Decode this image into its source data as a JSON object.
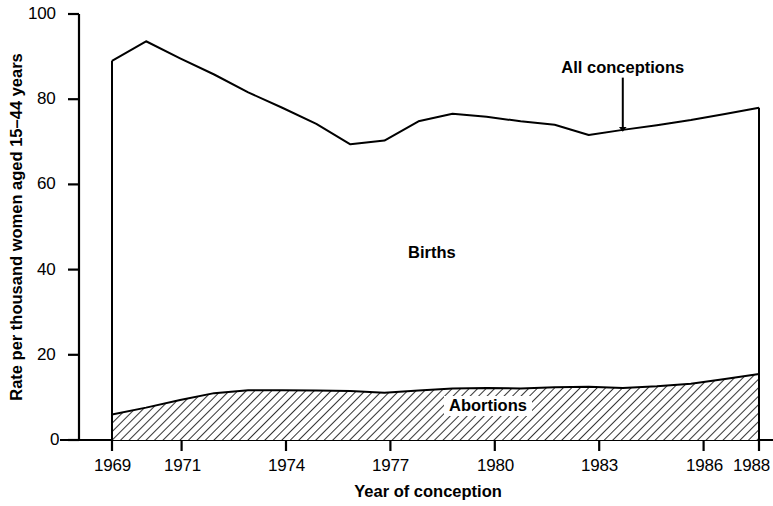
{
  "chart_data": {
    "type": "area",
    "title": "",
    "subtitle": "",
    "xlabel": "Year of conception",
    "ylabel": "Rate per thousand women aged 15–44 years",
    "xlim": [
      1969,
      1988
    ],
    "ylim": [
      0,
      100
    ],
    "grid": false,
    "legend_position": "inline-annotations",
    "x_tick_labels": [
      "1969",
      "1971",
      "1974",
      "1977",
      "1980",
      "1983",
      "1986",
      "1988"
    ],
    "x_tick_values": [
      1969,
      1971,
      1974,
      1977,
      1980,
      1983,
      1986,
      1988
    ],
    "y_tick_labels": [
      "0",
      "20",
      "40",
      "60",
      "80",
      "100"
    ],
    "y_tick_values": [
      0,
      20,
      40,
      60,
      80,
      100
    ],
    "x": [
      1969,
      1970,
      1971,
      1972,
      1973,
      1974,
      1975,
      1976,
      1977,
      1978,
      1979,
      1980,
      1981,
      1982,
      1983,
      1984,
      1985,
      1986,
      1987,
      1988
    ],
    "series": [
      {
        "name": "All conceptions",
        "style": "line",
        "values": [
          89.0,
          93.6,
          89.6,
          85.8,
          81.6,
          78.0,
          74.2,
          69.4,
          70.3,
          74.8,
          76.6,
          75.9,
          74.8,
          74.0,
          71.6,
          72.8,
          73.9,
          75.1,
          76.5,
          78.0
        ]
      },
      {
        "name": "Abortions",
        "style": "area-hatched",
        "values": [
          6.0,
          7.6,
          9.4,
          11.0,
          11.7,
          11.7,
          11.6,
          11.5,
          11.1,
          11.6,
          12.1,
          12.2,
          12.1,
          12.4,
          12.5,
          12.2,
          12.6,
          13.2,
          14.3,
          15.5
        ]
      },
      {
        "name": "Births",
        "style": "band-between",
        "values": [
          83.0,
          86.0,
          80.2,
          74.8,
          69.9,
          66.3,
          62.6,
          57.9,
          59.2,
          63.2,
          64.5,
          63.7,
          62.7,
          61.6,
          59.1,
          60.6,
          61.3,
          61.9,
          62.2,
          62.5
        ]
      }
    ],
    "annotations": [
      {
        "name": "all-conceptions",
        "text": "All conceptions",
        "x": 1984.0,
        "y": 86.0,
        "arrow": true,
        "arrow_to_y": 73.0
      },
      {
        "name": "births",
        "text": "Births",
        "x": 1977.0,
        "y": 41.0,
        "arrow": false,
        "boxed": false
      },
      {
        "name": "abortions",
        "text": "Abortions",
        "x": 1980.0,
        "y": 7.5,
        "arrow": false,
        "boxed": true
      }
    ]
  },
  "chart_labels": {
    "ylabel": "Rate per thousand women aged 15–44 years",
    "xlabel": "Year of conception",
    "annot_all_conceptions": "All conceptions",
    "annot_births": "Births",
    "annot_abortions": "Abortions",
    "ytick_0": "0",
    "ytick_20": "20",
    "ytick_40": "40",
    "ytick_60": "60",
    "ytick_80": "80",
    "ytick_100": "100",
    "xtick_1969": "1969",
    "xtick_1971": "1971",
    "xtick_1974": "1974",
    "xtick_1977": "1977",
    "xtick_1980": "1980",
    "xtick_1983": "1983",
    "xtick_1986": "1986",
    "xtick_1988": "1988"
  },
  "colors": {
    "line": "#000000",
    "hatch": "#000000",
    "background": "#ffffff",
    "axis": "#000000"
  }
}
